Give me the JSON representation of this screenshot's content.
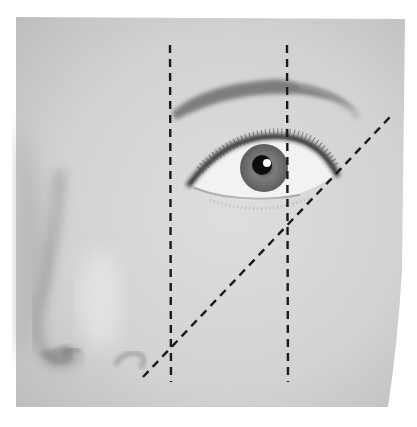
{
  "figure": {
    "background_color": "#ffffff",
    "skin_base_color": "#cfcfcf",
    "guide_line_color": "#1a1a1a"
  },
  "guide_lines": [
    {
      "name": "brow-start-line",
      "type": "vertical",
      "x1": 170,
      "y1": 45,
      "x2": 171,
      "y2": 382
    },
    {
      "name": "brow-arch-line",
      "type": "vertical",
      "x1": 287,
      "y1": 45,
      "x2": 288,
      "y2": 382
    },
    {
      "name": "brow-end-line",
      "type": "diagonal",
      "x1": 143,
      "y1": 377,
      "x2": 390,
      "y2": 117
    }
  ],
  "features": {
    "eyebrow": "dark arched brow from x≈170 to x≈290, tapering toward the temple",
    "eye": "open eye with dark iris, bright catchlight, upper lashes",
    "nose": "nose bridge and nostrils at lower left"
  }
}
